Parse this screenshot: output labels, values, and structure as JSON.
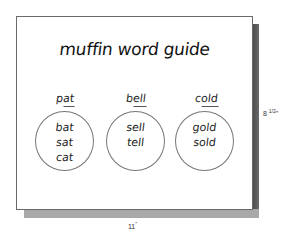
{
  "card": {
    "title": "muffin word guide",
    "columns": [
      {
        "heading_onset": "p",
        "heading_rime": "at",
        "heading_full": "pat",
        "words": [
          "bat",
          "sat",
          "cat"
        ]
      },
      {
        "heading_onset": "b",
        "heading_rime": "ell",
        "heading_full": "bell",
        "words": [
          "sell",
          "tell"
        ]
      },
      {
        "heading_onset": "c",
        "heading_rime": "old",
        "heading_full": "cold",
        "words": [
          "gold",
          "sold"
        ]
      }
    ]
  },
  "dimensions": {
    "height_main": "8 ",
    "height_fraction": "1/2",
    "height_unit": "\"",
    "width_main": "11",
    "width_unit": "\""
  },
  "colors": {
    "card_bg": "#ffffff",
    "card_border": "#6a6a6a",
    "shadow_right": "#4a4a4a",
    "shadow_bottom": "#a9a9a9",
    "text": "#1a1a1a"
  }
}
